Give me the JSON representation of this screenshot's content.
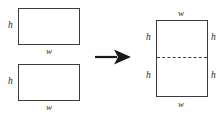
{
  "diagram": {
    "stroke_color": "#3d3d3d",
    "background_color": "#ffffff",
    "left_group": {
      "rect_top": {
        "name": "rectangle-1",
        "height_label": "h",
        "width_label": "w"
      },
      "rect_bottom": {
        "name": "rectangle-2",
        "height_label": "h",
        "width_label": "w"
      }
    },
    "operator": {
      "symbol": "→",
      "name": "right-arrow",
      "meaning": "becomes"
    },
    "right_group": {
      "rect_combined": {
        "name": "combined-rectangle",
        "width_label_top": "w",
        "width_label_bottom": "w",
        "height_label_top_left": "h",
        "height_label_top_right": "h",
        "height_label_bottom_left": "h",
        "height_label_bottom_right": "h",
        "divider": "dashed"
      }
    }
  }
}
